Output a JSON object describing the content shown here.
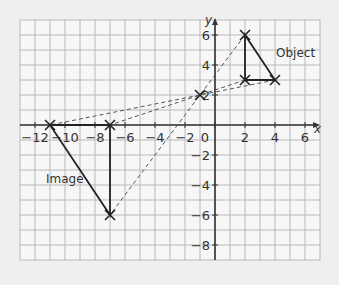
{
  "diagram": {
    "axes": {
      "x_label": "x",
      "y_label": "y",
      "x_range": [
        -13,
        7
      ],
      "y_range": [
        -9,
        7
      ],
      "x_ticks": [
        {
          "value": -12,
          "label": "−12"
        },
        {
          "value": -10,
          "label": "−10"
        },
        {
          "value": -8,
          "label": "−8"
        },
        {
          "value": -6,
          "label": "−6"
        },
        {
          "value": -4,
          "label": "−4"
        },
        {
          "value": -2,
          "label": "−2"
        },
        {
          "value": 0,
          "label": "0"
        },
        {
          "value": 2,
          "label": "2"
        },
        {
          "value": 4,
          "label": "4"
        },
        {
          "value": 6,
          "label": "6"
        }
      ],
      "y_ticks": [
        {
          "value": 6,
          "label": "6"
        },
        {
          "value": 4,
          "label": "4"
        },
        {
          "value": 2,
          "label": "2"
        },
        {
          "value": -2,
          "label": "−2"
        },
        {
          "value": -4,
          "label": "−4"
        },
        {
          "value": -6,
          "label": "−6"
        },
        {
          "value": -8,
          "label": "−8"
        }
      ]
    },
    "object": {
      "label": "Object",
      "vertices": [
        [
          2,
          6
        ],
        [
          2,
          3
        ],
        [
          4,
          3
        ]
      ]
    },
    "image": {
      "label": "Image",
      "vertices": [
        [
          -7,
          -6
        ],
        [
          -7,
          0
        ],
        [
          -11,
          0
        ]
      ]
    },
    "centre_of_enlargement": [
      -1,
      2
    ],
    "construction_lines": [
      {
        "from": [
          4,
          3
        ],
        "to": [
          -11,
          0
        ]
      },
      {
        "from": [
          2,
          3
        ],
        "to": [
          -7,
          0
        ]
      },
      {
        "from": [
          2,
          6
        ],
        "to": [
          -7,
          -6
        ]
      }
    ],
    "colors": {
      "background": "#efefef",
      "grid_bg": "#f7f7f7",
      "grid_line": "#b8b8b8",
      "axis": "#333333",
      "shape": "#222222",
      "dashed": "#555555"
    }
  }
}
